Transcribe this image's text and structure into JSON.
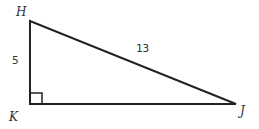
{
  "diagram": {
    "type": "right-triangle",
    "vertices": {
      "H": {
        "label": "H"
      },
      "K": {
        "label": "K"
      },
      "J": {
        "label": "J"
      }
    },
    "sides": {
      "HK": {
        "label": "5"
      },
      "HJ": {
        "label": "13"
      }
    },
    "right_angle_at": "K",
    "stroke_color": "#222222"
  }
}
